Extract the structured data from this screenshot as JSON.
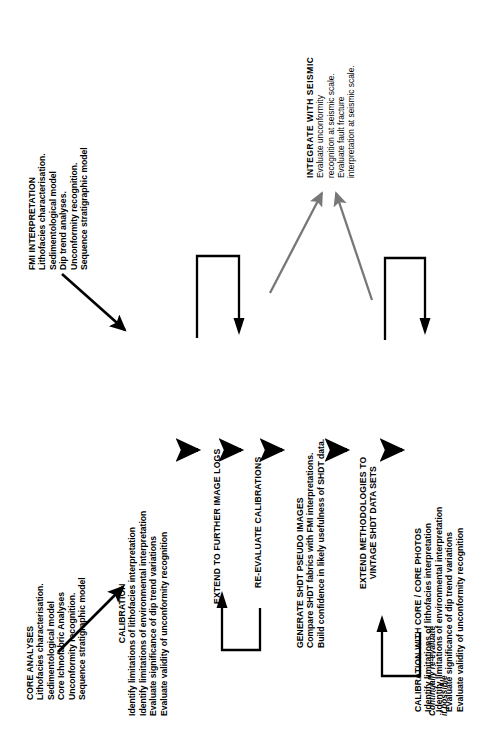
{
  "diagram": {
    "orientation": "rotated-90-ccw",
    "colors": {
      "ink": "#000000",
      "accent_gray": "#777777",
      "background": "#ffffff"
    }
  },
  "blocks": {
    "fmi": {
      "heading": "FMI INTERPRETATION",
      "lines": [
        "Lithofacies characterisation.",
        "Sedimentological model",
        "Dip trend analyses.",
        "Unconformity recognition.",
        "Sequence stratigraphic model"
      ]
    },
    "core": {
      "heading": "CORE ANALYSES",
      "lines": [
        "Lithofacies characterisation.",
        "Sedimentological model",
        "Core Ichnofabric Analyses",
        "Unconformity recognition.",
        "Sequence stratigraphic model"
      ]
    },
    "calibration": {
      "heading": "CALIBRATION",
      "lines": [
        "Identify limitations of lithofacies interpretation",
        "Identify limitations of environmental interpretation",
        "Evaluate significance of dip trend variations",
        "Evaluate validity of unconformity recognition"
      ]
    },
    "extend_logs": {
      "heading": "EXTEND TO FURTHER IMAGE LOGS",
      "lines": []
    },
    "reevaluate": {
      "heading": "RE-EVALUATE CALIBRATIONS",
      "lines": []
    },
    "pseudo": {
      "heading": "GENERATE  SHDT PSEUDO IMAGES",
      "lines": [
        "Compare SHDT fabrics with FMI interpretations.",
        "Build confidence in likely usefulness of SHDT data."
      ]
    },
    "vintage": {
      "heading": "EXTEND METHODOLOGIES TO",
      "heading2": "VINTAGE SHDT DATA SETS",
      "lines": []
    },
    "core_photos": {
      "heading": "CALIBRATION WITH CORE / CORE PHOTOS",
      "lines": [
        "Identify limitations of lithofacies interpretation",
        "Identify limitations of environmental interpretation",
        "Evaluate significance of dip trend variations",
        "Evaluate validity of unconformity recognition"
      ]
    },
    "seismic": {
      "heading": "INTEGRATE  WITH SEISMIC",
      "lines": [
        "Evaluate unconformity",
        "recognition at seismic scale.",
        "Evaluate fault fracture",
        "interpretation at seismic scale."
      ]
    }
  },
  "annotations": {
    "feedback_note_line1": "Continually re-evaluate",
    "feedback_note_line2": "if possible"
  },
  "connectors": [
    {
      "name": "fmi-to-calibration",
      "style": "diagonal-arrow",
      "color": "#000000"
    },
    {
      "name": "core-to-calibration",
      "style": "diagonal-arrow",
      "color": "#000000"
    },
    {
      "name": "calibration-to-extend-logs",
      "style": "straight-arrow",
      "color": "#000000"
    },
    {
      "name": "extend-logs-to-reevaluate",
      "style": "straight-arrow",
      "color": "#000000"
    },
    {
      "name": "reevaluate-to-pseudo",
      "style": "straight-arrow",
      "color": "#000000"
    },
    {
      "name": "pseudo-to-vintage",
      "style": "straight-arrow",
      "color": "#000000"
    },
    {
      "name": "vintage-to-core-photos",
      "style": "straight-arrow",
      "color": "#000000"
    },
    {
      "name": "pseudo-to-seismic",
      "style": "diagonal-arrow",
      "color": "#777777"
    },
    {
      "name": "vintage-to-seismic",
      "style": "diagonal-arrow",
      "color": "#777777"
    },
    {
      "name": "loop-reevaluate-back",
      "style": "u-loop",
      "color": "#000000"
    },
    {
      "name": "loop-core-photos-back",
      "style": "u-loop",
      "color": "#000000"
    },
    {
      "name": "loop-calibration-feedback",
      "style": "u-loop",
      "color": "#000000"
    },
    {
      "name": "loop-pseudo-feedback",
      "style": "u-loop",
      "color": "#000000"
    }
  ]
}
